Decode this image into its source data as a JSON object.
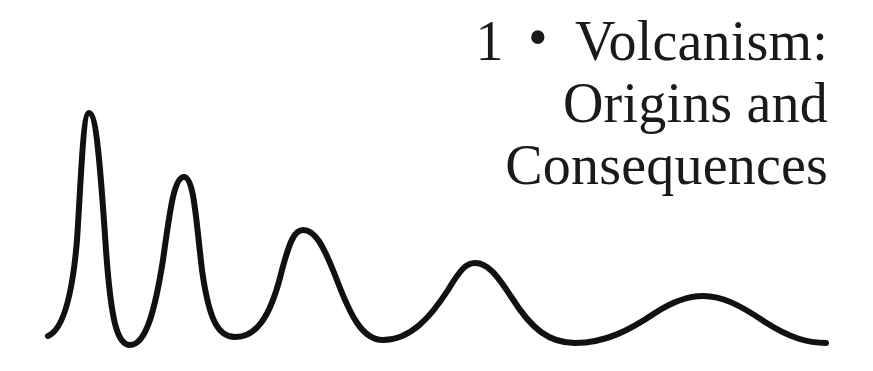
{
  "chapter": {
    "number": "1",
    "separator": "•",
    "title_lines": [
      "Volcanism:",
      "Origins and",
      "Consequences"
    ]
  },
  "decoration": {
    "type": "damped-wave",
    "stroke_color": "#111111",
    "peaks": 5
  }
}
